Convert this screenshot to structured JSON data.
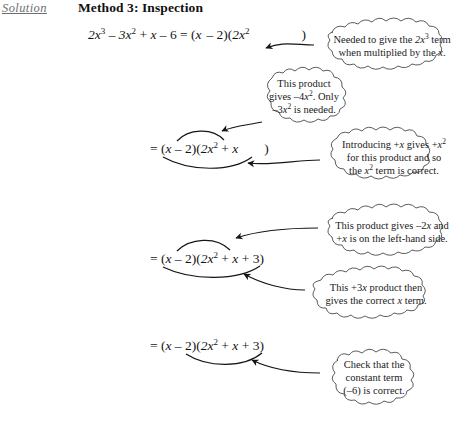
{
  "header": {
    "solution_label": "Solution",
    "method_title": "Method 3: Inspection"
  },
  "equations": [
    {
      "id": "eq1",
      "text": "2x³ – 3x² + x – 6 = (x  – 2)(2x²          )"
    },
    {
      "id": "eq2",
      "text": "= (x – 2)(2x² + x      )"
    },
    {
      "id": "eq3",
      "text": "= (x – 2)(2x² + x + 3)"
    },
    {
      "id": "eq4",
      "text": "= (x – 2)(2x² + x + 3)"
    }
  ],
  "callouts": [
    {
      "id": "b1",
      "lines": [
        "Needed to give the 2x³ term",
        "when multiplied by the x."
      ]
    },
    {
      "id": "b2",
      "lines": [
        "This product",
        "gives –4x². Only",
        "–3x² is needed."
      ]
    },
    {
      "id": "b3",
      "lines": [
        "Introducing +x gives +x²",
        "for this product and so",
        "the x² term is correct."
      ]
    },
    {
      "id": "b4",
      "lines": [
        "This product gives –2x and",
        "+x is on the left-hand side."
      ]
    },
    {
      "id": "b5",
      "lines": [
        "This +3x product then",
        "gives the correct x term."
      ]
    },
    {
      "id": "b6",
      "lines": [
        "Check that the",
        "constant term",
        "(–6) is correct."
      ]
    }
  ],
  "colors": {
    "text": "#141414",
    "solution_label": "#6f6f6f",
    "ink": "#1a1a1a",
    "background": "#ffffff"
  }
}
